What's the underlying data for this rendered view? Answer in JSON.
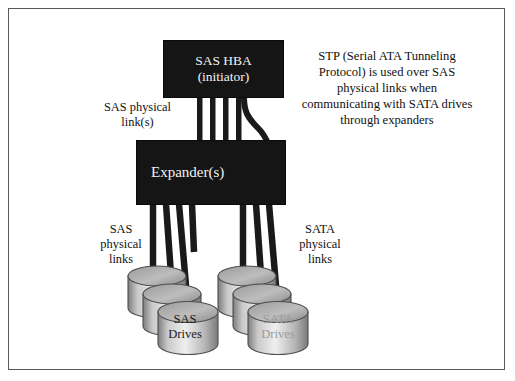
{
  "figure": {
    "background": "#ffffff",
    "border_color": "#58585a"
  },
  "blocks": {
    "hba": {
      "line1": "SAS HBA",
      "line2": "(initiator)",
      "fill": "#151515",
      "text_color": "#f2f2f2"
    },
    "expander": {
      "label": "Expander(s)",
      "fill": "#151515",
      "text_color": "#f2f2f2"
    }
  },
  "labels": {
    "sas_link": "SAS physical\nlink(s)",
    "sas_physical": "SAS\nphysical\nlinks",
    "sata_physical": "SATA\nphysical\nlinks"
  },
  "note": {
    "text": "STP (Serial ATA Tunneling Protocol) is used over SAS physical links when communicating with SATA drives through expanders"
  },
  "drives": {
    "sas": {
      "line1": "SAS",
      "line2": "Drives",
      "text_color": "#1b1b1b",
      "count": 3
    },
    "sata": {
      "line1": "SATA",
      "line2": "Drives",
      "text_color": "#9a9a9a",
      "count": 3
    }
  },
  "cables": {
    "color": "#1a1a1a",
    "hba_to_expander_count": 4,
    "curved_count": 1,
    "expander_to_sas_count": 3,
    "expander_to_sata_count": 3
  }
}
